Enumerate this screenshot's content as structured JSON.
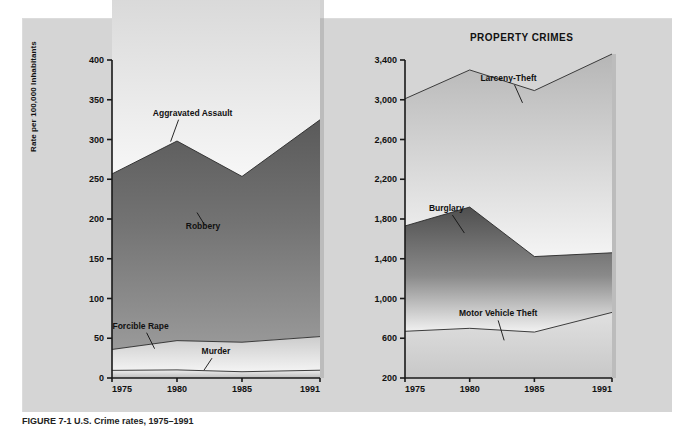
{
  "figure": {
    "caption": "FIGURE 7-1   U.S. Crime rates, 1975–1991"
  },
  "panel": {
    "background_color": "#d5d5d5"
  },
  "chart_data": [
    {
      "type": "area",
      "title": "VIOLENT CRIMES",
      "stacked": true,
      "xlabel": "",
      "ylabel": "Rate per 100,000 Inhabitants",
      "x": [
        1975,
        1980,
        1985,
        1991
      ],
      "xticklabels": [
        "1975",
        "1980",
        "1985",
        "1991"
      ],
      "ylim": [
        0,
        400
      ],
      "yticks": [
        0,
        50,
        100,
        150,
        200,
        250,
        300,
        350,
        400
      ],
      "yticklabels": [
        "0",
        "50",
        "100",
        "150",
        "200",
        "250",
        "300",
        "350",
        "400"
      ],
      "grid": false,
      "legend": "inline-annotations",
      "series": [
        {
          "name": "Murder",
          "values": [
            9.6,
            10.2,
            7.9,
            9.8
          ],
          "color": "#e9e9e9"
        },
        {
          "name": "Forcible Rape",
          "values": [
            26.3,
            36.8,
            37.1,
            42.3
          ],
          "color": "#cfcfcf"
        },
        {
          "name": "Robbery",
          "values": [
            220.8,
            251.1,
            208.5,
            272.7
          ],
          "color": "#6f6f6f"
        },
        {
          "name": "Aggravated Assault",
          "values": [
            231.1,
            298.5,
            302.9,
            433.5
          ],
          "color": "#c2c2c2"
        }
      ],
      "annotations": [
        {
          "label": "Aggravated Assault",
          "x": 1981.2,
          "y": 330
        },
        {
          "label": "Robbery",
          "x": 1982.0,
          "y": 188
        },
        {
          "label": "Forcible Rape",
          "x": 1977.2,
          "y": 62
        },
        {
          "label": "Murder",
          "x": 1983.0,
          "y": 30
        }
      ]
    },
    {
      "type": "area",
      "title": "PROPERTY CRIMES",
      "stacked": true,
      "xlabel": "",
      "ylabel": "",
      "x": [
        1975,
        1980,
        1985,
        1991
      ],
      "xticklabels": [
        "1975",
        "1980",
        "1985",
        "1991"
      ],
      "ylim": [
        200,
        3400
      ],
      "yticks": [
        200,
        600,
        1000,
        1400,
        1800,
        2200,
        2600,
        3000,
        3400
      ],
      "yticklabels": [
        "200",
        "600",
        "1,000",
        "1,400",
        "1,800",
        "2,200",
        "2,600",
        "3,000",
        "3,400"
      ],
      "grid": false,
      "legend": "inline-annotations",
      "series": [
        {
          "name": "Motor Vehicle Theft",
          "values": [
            470,
            500,
            462,
            660
          ],
          "color": "#cfcfcf"
        },
        {
          "name": "Burglary",
          "values": [
            1060,
            1220,
            760,
            600
          ],
          "color": "#6f6f6f"
        },
        {
          "name": "Larceny-Theft",
          "values": [
            1280,
            1380,
            1670,
            2000
          ],
          "color": "#c2c2c2"
        }
      ],
      "annotations": [
        {
          "label": "Larceny-Theft",
          "x": 1983.0,
          "y": 3190
        },
        {
          "label": "Burglary",
          "x": 1978.2,
          "y": 1880
        },
        {
          "label": "Motor Vehicle Theft",
          "x": 1982.2,
          "y": 820
        }
      ]
    }
  ]
}
